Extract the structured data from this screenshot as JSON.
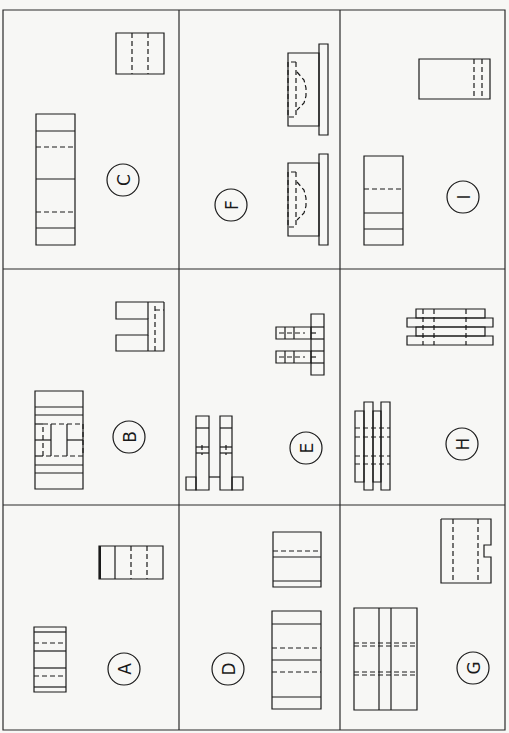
{
  "page": {
    "header_fragment": "page",
    "layout": "3x3 grid of orthographic projection exercises"
  },
  "problems": [
    {
      "id": "C",
      "label": "C",
      "cell": "row1-col1"
    },
    {
      "id": "F",
      "label": "F",
      "cell": "row1-col2"
    },
    {
      "id": "I",
      "label": "I",
      "cell": "row1-col3"
    },
    {
      "id": "B",
      "label": "B",
      "cell": "row2-col1"
    },
    {
      "id": "E",
      "label": "E",
      "cell": "row2-col2"
    },
    {
      "id": "H",
      "label": "H",
      "cell": "row2-col3"
    },
    {
      "id": "A",
      "label": "A",
      "cell": "row3-col1"
    },
    {
      "id": "D",
      "label": "D",
      "cell": "row3-col2"
    },
    {
      "id": "G",
      "label": "G",
      "cell": "row3-col3"
    }
  ],
  "labels": {
    "A": "A",
    "B": "B",
    "C": "C",
    "D": "D",
    "E": "E",
    "F": "F",
    "G": "G",
    "H": "H",
    "I": "I"
  },
  "colors": {
    "ink": "#1a1a1a",
    "paper": "#f7f7f5"
  }
}
